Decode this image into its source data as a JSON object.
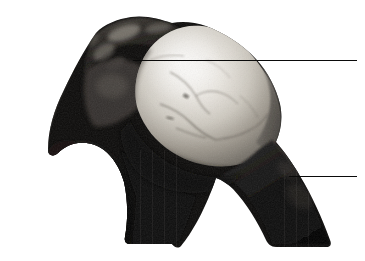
{
  "figure": {
    "kind": "anatomical-specimen-photograph",
    "background_color": "#ffffff",
    "width": 365,
    "height": 261,
    "caption": "",
    "label_1": "",
    "label_2": ""
  },
  "photo": {
    "tone_min_hex": "#050505",
    "tone_max_hex": "#f2f0ec",
    "bone_highlight_hex": "#e8e5df",
    "bone_midtone_hex": "#a9a49c",
    "shadow_hex": "#0b0b0b",
    "dark_mass_hex": "#141414",
    "rim_hex": "#5a564f"
  },
  "leaders": [
    {
      "name": "upper-leader-line",
      "x1": 133,
      "y1": 60,
      "x2": 357,
      "y2": 60,
      "color": "#0a0a0a"
    },
    {
      "name": "lower-leader-line",
      "x1": 289,
      "y1": 176,
      "x2": 357,
      "y2": 176,
      "color": "#0a0a0a"
    }
  ],
  "annotations": {
    "upper_label": "",
    "lower_label": ""
  }
}
